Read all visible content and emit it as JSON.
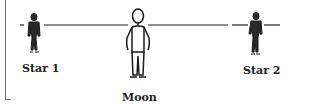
{
  "diagram": {
    "line_color": "#222222",
    "figures": [
      {
        "id": "star1",
        "label": "Star 1"
      },
      {
        "id": "moon",
        "label": "Moon"
      },
      {
        "id": "star2",
        "label": "Star 2"
      }
    ]
  }
}
